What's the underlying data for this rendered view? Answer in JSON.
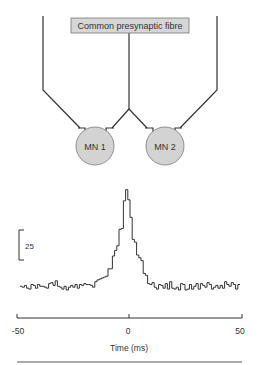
{
  "diagram": {
    "box_label": "Common presynaptic fibre",
    "box_fill": "#d6d6d6",
    "neurons": [
      {
        "label": "MN 1",
        "fill": "#d3d3d3"
      },
      {
        "label": "MN 2",
        "fill": "#d3d3d3"
      }
    ]
  },
  "scale_bar": {
    "label": "25"
  },
  "chart_data": {
    "type": "line",
    "subtype": "step-histogram (cross-correlogram)",
    "title": "",
    "xlabel": "Time (ms)",
    "ylabel": "",
    "xlim": [
      -50,
      50
    ],
    "x_ticks": [
      -50,
      0,
      50
    ],
    "x_tick_labels": [
      "-50",
      "0",
      "50"
    ],
    "scale_bar_counts": 25,
    "grid": false,
    "legend": null,
    "bin_width_ms": 1,
    "x": [
      -50,
      -49,
      -48,
      -47,
      -46,
      -45,
      -44,
      -43,
      -42,
      -41,
      -40,
      -39,
      -38,
      -37,
      -36,
      -35,
      -34,
      -33,
      -32,
      -31,
      -30,
      -29,
      -28,
      -27,
      -26,
      -25,
      -24,
      -23,
      -22,
      -21,
      -20,
      -19,
      -18,
      -17,
      -16,
      -15,
      -14,
      -13,
      -12,
      -11,
      -10,
      -9,
      -8,
      -7,
      -6,
      -5,
      -4,
      -3,
      -2,
      -1,
      0,
      1,
      2,
      3,
      4,
      5,
      6,
      7,
      8,
      9,
      10,
      11,
      12,
      13,
      14,
      15,
      16,
      17,
      18,
      19,
      20,
      21,
      22,
      23,
      24,
      25,
      26,
      27,
      28,
      29,
      30,
      31,
      32,
      33,
      34,
      35,
      36,
      37,
      38,
      39,
      40,
      41,
      42,
      43,
      44,
      45,
      46,
      47,
      48,
      49
    ],
    "values": [
      4,
      3,
      5,
      2,
      1,
      6,
      5,
      2,
      6,
      4,
      4,
      3,
      2,
      7,
      8,
      5,
      10,
      4,
      3,
      1,
      4,
      0,
      3,
      5,
      3,
      6,
      2,
      6,
      5,
      7,
      6,
      6,
      5,
      3,
      9,
      11,
      12,
      13,
      14,
      15,
      23,
      23,
      37,
      43,
      48,
      66,
      67,
      97,
      109,
      98,
      79,
      55,
      52,
      38,
      35,
      32,
      18,
      16,
      7,
      6,
      8,
      3,
      1,
      6,
      5,
      2,
      7,
      1,
      9,
      2,
      1,
      3,
      0,
      7,
      6,
      0,
      1,
      6,
      1,
      4,
      7,
      1,
      7,
      5,
      3,
      8,
      6,
      1,
      3,
      5,
      2,
      5,
      2,
      9,
      6,
      4,
      8,
      6,
      1,
      6
    ],
    "baseline_counts": 4,
    "peak": {
      "time_ms": -1,
      "counts": 109
    }
  }
}
